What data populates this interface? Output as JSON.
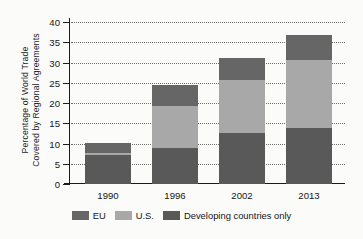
{
  "chart_data": {
    "type": "bar",
    "stacked": true,
    "title": "",
    "xlabel": "",
    "ylabel": "Percentage of World Trade Covered by Regional Agreements",
    "ylabel_lines": [
      "Percentage of World Trade",
      "Covered by Regional Agreements"
    ],
    "categories": [
      "1990",
      "1996",
      "2002",
      "2013"
    ],
    "ylim": [
      0,
      40
    ],
    "yticks": [
      0,
      5,
      10,
      15,
      20,
      25,
      30,
      35,
      40
    ],
    "ytick_labels": [
      "0",
      "5",
      "10",
      "15",
      "20",
      "25",
      "30",
      "35",
      "40"
    ],
    "grid": true,
    "grid_style": "dotted",
    "legend_position": "bottom",
    "series": [
      {
        "name": "Developing countries only",
        "color": "#595959",
        "values": [
          7.2,
          8.8,
          12.6,
          13.8
        ]
      },
      {
        "name": "U.S.",
        "color": "#a8a8a8",
        "values": [
          0.4,
          10.4,
          13.2,
          16.8
        ]
      },
      {
        "name": "EU",
        "color": "#666666",
        "values": [
          2.6,
          5.3,
          5.2,
          6.1
        ]
      }
    ],
    "stack_order_bottom_to_top": [
      "Developing countries only",
      "U.S.",
      "EU"
    ],
    "totals": [
      10.2,
      24.5,
      31.0,
      36.7
    ]
  },
  "legend": {
    "items": [
      {
        "label": "EU",
        "color": "#666666"
      },
      {
        "label": "U.S.",
        "color": "#a8a8a8"
      },
      {
        "label": "Developing countries only",
        "color": "#595959"
      }
    ]
  }
}
